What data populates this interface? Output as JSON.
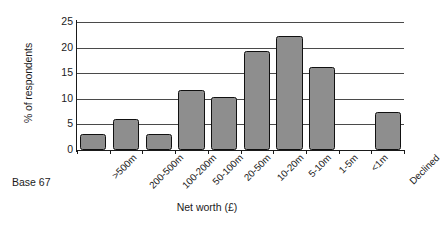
{
  "chart_data": {
    "type": "bar",
    "title": "",
    "xlabel": "Net worth (£)",
    "ylabel": "% of respondents",
    "categories": [
      ">500m",
      "200-500m",
      "100-200m",
      "50-100m",
      "20-50m",
      "10-20m",
      "5-10m",
      "1-5m",
      "<1m",
      "Declined"
    ],
    "values": [
      3.2,
      6.0,
      3.2,
      11.8,
      10.4,
      19.4,
      22.2,
      16.3,
      0,
      7.4
    ],
    "ylim": [
      0,
      25
    ],
    "yticks": [
      0,
      5,
      10,
      15,
      20,
      25
    ],
    "ytick_labels": [
      "0",
      "5",
      "10",
      "15",
      "20",
      "25"
    ],
    "grid": true,
    "legend": "none",
    "bar_fill": "#8e8e8e",
    "bar_border": "#111111"
  },
  "annotations": {
    "base_note": "Base 67"
  }
}
